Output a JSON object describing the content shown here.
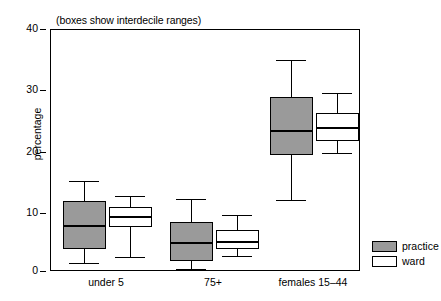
{
  "chart_data": {
    "type": "box",
    "title": "(boxes show interdecile ranges)",
    "xlabel": "",
    "ylabel": "percentage",
    "ylim": [
      0,
      40
    ],
    "yticks": [
      0,
      10,
      20,
      30,
      40
    ],
    "ytick_labels": [
      "0",
      "10",
      "20",
      "30",
      "40"
    ],
    "grid": false,
    "legend_position": "right",
    "note": "Boxes span the interdecile range (10th-90th percentile); thick line is the median; whiskers show the full range.",
    "categories": [
      "under 5",
      "75+",
      "females 15–44"
    ],
    "series": [
      {
        "name": "practice",
        "color": "#9a9a9a",
        "boxes": [
          {
            "category": "under 5",
            "whisker_low": 1.5,
            "box_low": 3.8,
            "median": 7.7,
            "box_high": 11.7,
            "whisker_high": 15.1
          },
          {
            "category": "75+",
            "whisker_low": 0.5,
            "box_low": 1.8,
            "median": 5.0,
            "box_high": 8.2,
            "whisker_high": 12.0
          },
          {
            "category": "females 15–44",
            "whisker_low": 11.9,
            "box_low": 19.4,
            "median": 23.5,
            "box_high": 29.0,
            "whisker_high": 35.0
          }
        ]
      },
      {
        "name": "ward",
        "color": "#ffffff",
        "boxes": [
          {
            "category": "under 5",
            "whisker_low": 2.5,
            "box_low": 7.4,
            "median": 9.2,
            "box_high": 10.7,
            "whisker_high": 12.6
          },
          {
            "category": "75+",
            "whisker_low": 2.6,
            "box_low": 3.8,
            "median": 5.2,
            "box_high": 6.9,
            "whisker_high": 9.5
          },
          {
            "category": "females 15–44",
            "whisker_low": 19.7,
            "box_low": 21.6,
            "median": 24.0,
            "box_high": 26.3,
            "whisker_high": 29.6
          }
        ]
      }
    ]
  },
  "caption": "(boxes show interdecile ranges)",
  "axes": {
    "y_label": "percentage",
    "y_ticks": [
      "40",
      "30",
      "20",
      "10",
      "0"
    ],
    "x_ticks": [
      "under 5",
      "75+",
      "females 15–44"
    ]
  },
  "legend": {
    "items": [
      {
        "label": "practice",
        "swatch": "practice-swatch"
      },
      {
        "label": "ward",
        "swatch": "ward-swatch"
      }
    ]
  }
}
